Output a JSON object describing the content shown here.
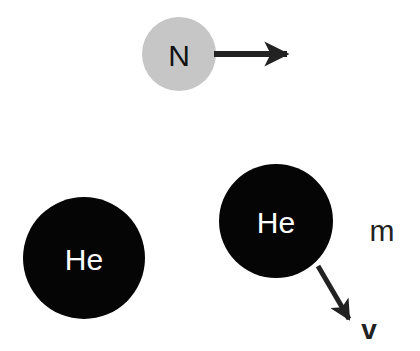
{
  "diagram": {
    "particles": [
      {
        "id": "nitrogen",
        "label": "N",
        "cx": 179,
        "cy": 54,
        "r": 37,
        "fill": "#c6c6c6",
        "text_color": "#111111"
      },
      {
        "id": "helium-left",
        "label": "He",
        "cx": 84,
        "cy": 258,
        "r": 61,
        "fill": "#050505",
        "text_color": "#ffffff"
      },
      {
        "id": "helium-right",
        "label": "He",
        "cx": 276,
        "cy": 221,
        "r": 57,
        "fill": "#050505",
        "text_color": "#ffffff"
      }
    ],
    "arrows": [
      {
        "id": "nitrogen-velocity",
        "from": [
          214,
          54
        ],
        "to": [
          287,
          54
        ]
      },
      {
        "id": "helium-velocity",
        "from": [
          318,
          266
        ],
        "to": [
          349,
          319
        ]
      }
    ],
    "annotations": {
      "mass_label": "m",
      "velocity_label": "v"
    }
  }
}
